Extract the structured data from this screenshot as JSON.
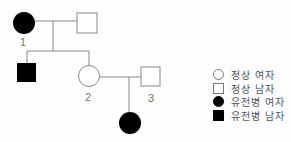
{
  "pedigree": {
    "individuals": [
      {
        "id": "I-1-female",
        "label": "1",
        "sex": "female",
        "affected": true
      },
      {
        "id": "I-male-spouse",
        "label": "",
        "sex": "male",
        "affected": false
      },
      {
        "id": "II-son",
        "label": "",
        "sex": "male",
        "affected": true
      },
      {
        "id": "II-2-female",
        "label": "2",
        "sex": "female",
        "affected": false
      },
      {
        "id": "II-3-male",
        "label": "3",
        "sex": "male",
        "affected": false
      },
      {
        "id": "III-daughter",
        "label": "",
        "sex": "female",
        "affected": true
      }
    ],
    "labels": {
      "one": "1",
      "two": "2",
      "three": "3"
    }
  },
  "legend": {
    "items": [
      {
        "shape": "circle",
        "filled": false,
        "label": "정상 여자"
      },
      {
        "shape": "square",
        "filled": false,
        "label": "정상 남자"
      },
      {
        "shape": "circle",
        "filled": true,
        "label": "유전병 여자"
      },
      {
        "shape": "square",
        "filled": true,
        "label": "유전병 남자"
      }
    ]
  },
  "colors": {
    "line": "#888888",
    "affected": "#000000",
    "unaffected": "#ffffff"
  }
}
